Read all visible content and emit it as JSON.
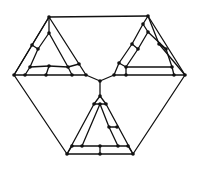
{
  "diagram": {
    "title": "",
    "stroke_color": "#111111",
    "background": "#ffffff",
    "nodes": [
      {
        "id": "o_tl",
        "x": 49,
        "y": 17
      },
      {
        "id": "o_tr",
        "x": 148,
        "y": 16
      },
      {
        "id": "o_r",
        "x": 185,
        "y": 75
      },
      {
        "id": "o_br",
        "x": 133,
        "y": 154
      },
      {
        "id": "o_bm",
        "x": 100,
        "y": 154
      },
      {
        "id": "o_bl",
        "x": 67,
        "y": 154
      },
      {
        "id": "o_l",
        "x": 14,
        "y": 75
      },
      {
        "id": "center",
        "x": 100,
        "y": 81
      },
      {
        "id": "L_a1",
        "x": 49,
        "y": 33
      },
      {
        "id": "L_b1",
        "x": 32,
        "y": 45
      },
      {
        "id": "L_b2",
        "x": 38,
        "y": 49
      },
      {
        "id": "L_c1",
        "x": 30,
        "y": 67
      },
      {
        "id": "L_c2",
        "x": 49,
        "y": 66
      },
      {
        "id": "L_c3",
        "x": 68,
        "y": 67
      },
      {
        "id": "L_d1",
        "x": 25,
        "y": 75
      },
      {
        "id": "L_d2",
        "x": 46,
        "y": 75
      },
      {
        "id": "L_d3",
        "x": 72,
        "y": 75
      },
      {
        "id": "L_e1",
        "x": 79,
        "y": 64
      },
      {
        "id": "L_e2",
        "x": 86,
        "y": 75
      },
      {
        "id": "R_a1",
        "x": 143,
        "y": 24
      },
      {
        "id": "R_a2",
        "x": 148,
        "y": 32
      },
      {
        "id": "R_b1",
        "x": 132,
        "y": 44
      },
      {
        "id": "R_b2",
        "x": 138,
        "y": 49
      },
      {
        "id": "R_c1",
        "x": 159,
        "y": 44
      },
      {
        "id": "R_c2",
        "x": 166,
        "y": 49
      },
      {
        "id": "R_d1",
        "x": 119,
        "y": 63
      },
      {
        "id": "R_d2",
        "x": 126,
        "y": 67
      },
      {
        "id": "R_d3",
        "x": 172,
        "y": 67
      },
      {
        "id": "R_e1",
        "x": 114,
        "y": 75
      },
      {
        "id": "R_e2",
        "x": 126,
        "y": 75
      },
      {
        "id": "R_e3",
        "x": 174,
        "y": 75
      },
      {
        "id": "B_a1",
        "x": 100,
        "y": 96
      },
      {
        "id": "B_a2",
        "x": 94,
        "y": 104
      },
      {
        "id": "B_a3",
        "x": 100,
        "y": 104
      },
      {
        "id": "B_a4",
        "x": 106,
        "y": 104
      },
      {
        "id": "B_b1",
        "x": 109,
        "y": 127
      },
      {
        "id": "B_b2",
        "x": 117,
        "y": 127
      },
      {
        "id": "B_c1",
        "x": 72,
        "y": 146
      },
      {
        "id": "B_c2",
        "x": 82,
        "y": 146
      },
      {
        "id": "B_c3",
        "x": 100,
        "y": 146
      },
      {
        "id": "B_c4",
        "x": 118,
        "y": 146
      },
      {
        "id": "B_c5",
        "x": 128,
        "y": 146
      }
    ],
    "edges": [
      [
        "o_tl",
        "o_tr"
      ],
      [
        "o_tr",
        "o_r"
      ],
      [
        "o_r",
        "o_br"
      ],
      [
        "o_br",
        "o_bm"
      ],
      [
        "o_bm",
        "o_bl"
      ],
      [
        "o_bl",
        "o_l"
      ],
      [
        "o_l",
        "o_tl"
      ],
      [
        "o_l",
        "L_d1"
      ],
      [
        "L_d1",
        "L_d2"
      ],
      [
        "L_d2",
        "L_d3"
      ],
      [
        "L_d3",
        "L_e2"
      ],
      [
        "L_e2",
        "center"
      ],
      [
        "o_tl",
        "L_e1"
      ],
      [
        "L_e1",
        "L_e2"
      ],
      [
        "o_tl",
        "L_b1"
      ],
      [
        "L_b1",
        "o_l"
      ],
      [
        "L_a1",
        "L_b2"
      ],
      [
        "L_b2",
        "L_c1"
      ],
      [
        "L_c1",
        "L_d1"
      ],
      [
        "L_b1",
        "L_b2"
      ],
      [
        "L_a1",
        "L_c3"
      ],
      [
        "L_c3",
        "L_d3"
      ],
      [
        "L_c1",
        "L_c2"
      ],
      [
        "L_c2",
        "L_c3"
      ],
      [
        "L_c2",
        "L_d2"
      ],
      [
        "L_c3",
        "L_e1"
      ],
      [
        "o_tl",
        "L_a1"
      ],
      [
        "o_tr",
        "R_a1"
      ],
      [
        "R_a1",
        "R_b1"
      ],
      [
        "R_b1",
        "R_d1"
      ],
      [
        "R_d1",
        "R_e1"
      ],
      [
        "R_e1",
        "center"
      ],
      [
        "o_tr",
        "R_c1"
      ],
      [
        "R_c1",
        "o_r"
      ],
      [
        "R_e1",
        "R_e2"
      ],
      [
        "R_e2",
        "R_e3"
      ],
      [
        "R_e3",
        "o_r"
      ],
      [
        "R_a2",
        "R_b2"
      ],
      [
        "R_b2",
        "R_d2"
      ],
      [
        "R_d2",
        "R_e2"
      ],
      [
        "R_a2",
        "R_c2"
      ],
      [
        "R_c2",
        "R_d3"
      ],
      [
        "R_d3",
        "R_e3"
      ],
      [
        "R_b1",
        "R_b2"
      ],
      [
        "R_c1",
        "R_c2"
      ],
      [
        "R_d2",
        "R_d3"
      ],
      [
        "R_d1",
        "R_d2"
      ],
      [
        "R_a1",
        "R_a2"
      ],
      [
        "center",
        "B_a1"
      ],
      [
        "B_a1",
        "B_a2"
      ],
      [
        "B_a1",
        "B_a4"
      ],
      [
        "B_a2",
        "B_a3"
      ],
      [
        "B_a3",
        "B_a4"
      ],
      [
        "B_a2",
        "o_bl"
      ],
      [
        "B_a4",
        "o_br"
      ],
      [
        "B_a3",
        "B_c2"
      ],
      [
        "B_a3",
        "B_b1"
      ],
      [
        "B_b1",
        "B_c4"
      ],
      [
        "B_b1",
        "B_b2"
      ],
      [
        "B_c1",
        "B_c2"
      ],
      [
        "B_c2",
        "B_c3"
      ],
      [
        "B_c3",
        "B_c4"
      ],
      [
        "B_c4",
        "B_c5"
      ],
      [
        "B_c3",
        "o_bm"
      ],
      [
        "B_c1",
        "o_bl"
      ],
      [
        "B_c5",
        "o_br"
      ]
    ]
  }
}
